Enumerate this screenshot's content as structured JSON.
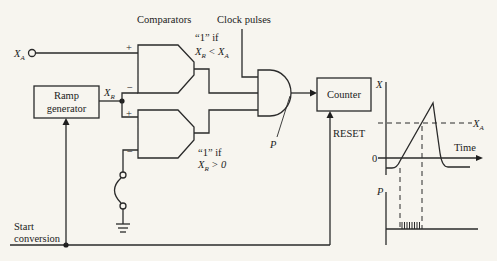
{
  "diagram": {
    "labels": {
      "comparators": "Comparators",
      "clock_pulses": "Clock pulses",
      "xa_input": "X",
      "xa_sub": "A",
      "xr": "X",
      "xr_sub": "R",
      "comp1_condition_line1": "“1” if",
      "comp1_condition_line2_a": "X",
      "comp1_condition_line2_sub": "R",
      "comp1_condition_line2_b": " < X",
      "comp1_condition_line2_sub2": "A",
      "comp2_condition_line1": "“1” if",
      "comp2_condition_line2_a": "X",
      "comp2_condition_line2_sub": "R",
      "comp2_condition_line2_b": " > 0",
      "plus": "+",
      "minus": "−",
      "p_label": "P",
      "reset": "RESET",
      "start_line1": "Start",
      "start_line2": "conversion"
    },
    "blocks": {
      "ramp_line1": "Ramp",
      "ramp_line2": "generator",
      "counter": "Counter"
    },
    "graph": {
      "y_axis_top": "X",
      "threshold_label": "X",
      "threshold_sub": "A",
      "time_label": "Time",
      "zero_label": "0",
      "pulse_axis_label": "P"
    }
  }
}
